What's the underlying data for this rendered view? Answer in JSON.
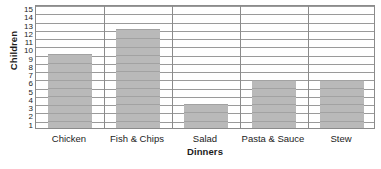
{
  "chart_data": {
    "type": "bar",
    "title": "",
    "xlabel": "Dinners",
    "ylabel": "Children",
    "categories": [
      "Chicken",
      "Fish & Chips",
      "Salad",
      "Pasta & Sauce",
      "Stew"
    ],
    "values": [
      9,
      12,
      2.9,
      5.8,
      5.8
    ],
    "series": [
      {
        "name": "Children",
        "values": [
          9,
          12,
          2.9,
          5.8,
          5.8
        ]
      }
    ],
    "ylim": [
      0,
      15
    ],
    "ytick_labels": [
      "1",
      "2",
      "3",
      "4",
      "5",
      "6",
      "7",
      "8",
      "9",
      "10",
      "11",
      "12",
      "13",
      "14",
      "15"
    ],
    "ytick_values": [
      1,
      2,
      3,
      4,
      5,
      6,
      7,
      8,
      9,
      10,
      11,
      12,
      13,
      14,
      15
    ],
    "grid": true,
    "grid_axis": "y",
    "legend": false,
    "legend_position": "none",
    "bar_color": "#b9b9b9",
    "grid_color": "#9a9a9a",
    "axis_color": "#8b8b8b",
    "text_color": "#1c1c1c",
    "background_color": "#ffffff"
  }
}
